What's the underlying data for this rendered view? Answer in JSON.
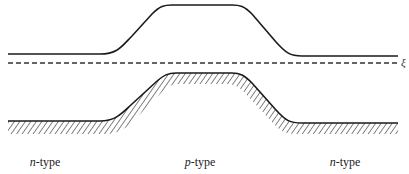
{
  "diagram": {
    "title": "",
    "conduction_band_edge": {
      "description": "Upper band edge raised over p-type region",
      "points": [
        [
          8,
          54
        ],
        [
          106,
          54
        ],
        [
          165,
          5
        ],
        [
          240,
          5
        ],
        [
          300,
          56
        ],
        [
          398,
          56
        ]
      ]
    },
    "fermi_level": {
      "symbol": "ξ",
      "style": "dashed",
      "y": 63
    },
    "valence_band_edge": {
      "description": "Lower band edge with hatching beneath, raised over p-type region",
      "points": [
        [
          8,
          121
        ],
        [
          106,
          121
        ],
        [
          172,
          73
        ],
        [
          240,
          73
        ],
        [
          300,
          123
        ],
        [
          398,
          123
        ]
      ],
      "hatched": true
    },
    "regions": [
      {
        "prefix": "n",
        "suffix": "-type",
        "x": 45
      },
      {
        "prefix": "p",
        "suffix": "-type",
        "x": 200
      },
      {
        "prefix": "n",
        "suffix": "-type",
        "x": 345
      }
    ],
    "colors": {
      "line": "#1a1a1a",
      "dashed": "#333333",
      "hatch": "#333333"
    }
  }
}
